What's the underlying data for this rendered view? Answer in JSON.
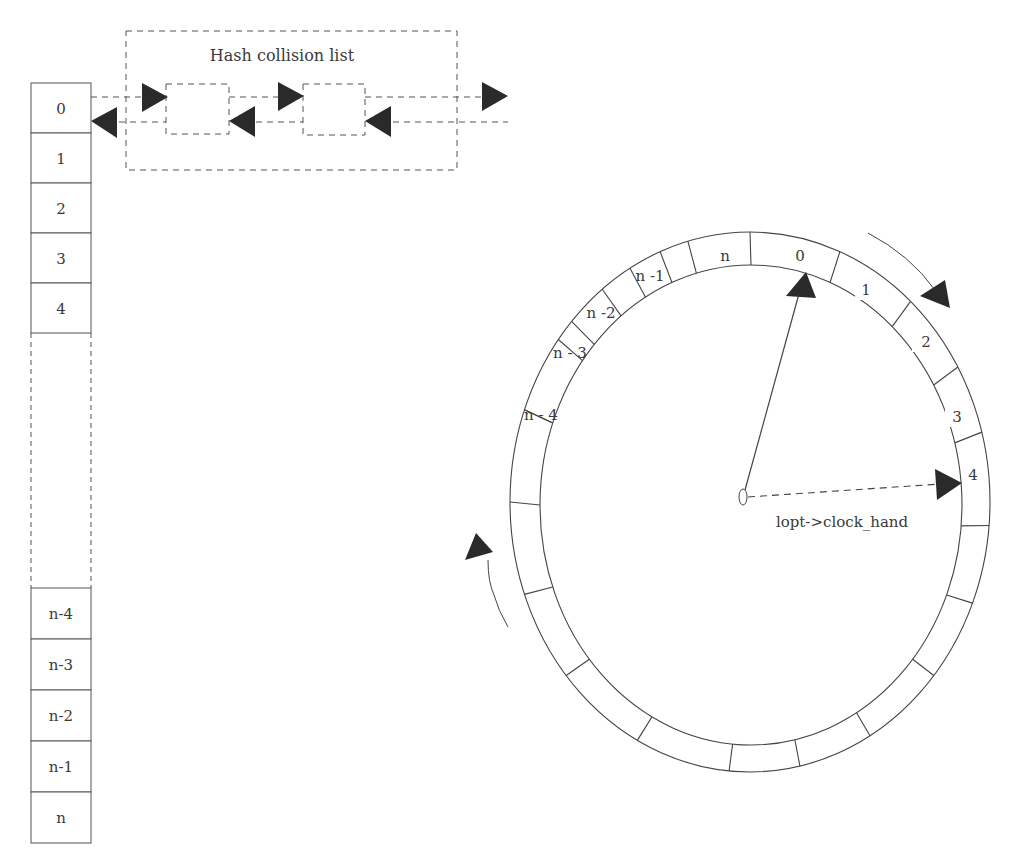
{
  "hash_table": {
    "slots_top": [
      "0",
      "1",
      "2",
      "3",
      "4"
    ],
    "slots_bottom": [
      "n-4",
      "n-3",
      "n-2",
      "n-1",
      "n"
    ]
  },
  "collision_list": {
    "title": "Hash collision list",
    "node_count": 2
  },
  "clock": {
    "segment_labels": [
      "n -1",
      "n",
      "0",
      "1",
      "2",
      "3",
      "4",
      "n -2",
      "n - 3",
      "n - 4"
    ],
    "hand_label": "lopt->clock_hand"
  },
  "colors": {
    "line": "#555555",
    "arrow": "#2a2a2a",
    "text": "#3a3a3a"
  }
}
